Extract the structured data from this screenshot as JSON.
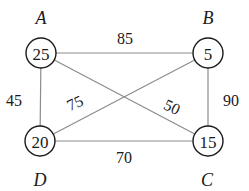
{
  "nodes": [
    {
      "id": "A",
      "label": "A",
      "value": "25",
      "x": 41,
      "y": 53,
      "label_x": 41,
      "label_y": 18
    },
    {
      "id": "B",
      "label": "B",
      "value": "5",
      "x": 208,
      "y": 53,
      "label_x": 208,
      "label_y": 18
    },
    {
      "id": "C",
      "label": "C",
      "value": "15",
      "x": 208,
      "y": 141,
      "label_x": 207,
      "label_y": 180
    },
    {
      "id": "D",
      "label": "D",
      "value": "20",
      "x": 40,
      "y": 141,
      "label_x": 40,
      "label_y": 180
    }
  ],
  "edges": [
    {
      "from": "A",
      "to": "B",
      "weight": "85",
      "wx": 125,
      "wy": 38,
      "rot": 0
    },
    {
      "from": "A",
      "to": "D",
      "weight": "45",
      "wx": 14,
      "wy": 100,
      "rot": 0
    },
    {
      "from": "B",
      "to": "C",
      "weight": "90",
      "wx": 231,
      "wy": 100,
      "rot": 0
    },
    {
      "from": "D",
      "to": "C",
      "weight": "70",
      "wx": 124,
      "wy": 157,
      "rot": 0
    },
    {
      "from": "D",
      "to": "B",
      "weight": "75",
      "wx": 75,
      "wy": 103,
      "rot": -25
    },
    {
      "from": "A",
      "to": "C",
      "weight": "50",
      "wx": 172,
      "wy": 107,
      "rot": 25
    }
  ],
  "colors": {
    "edge": "#8c8c8c",
    "node_stroke": "#1a1a1a",
    "text": "#1a1a1a"
  }
}
